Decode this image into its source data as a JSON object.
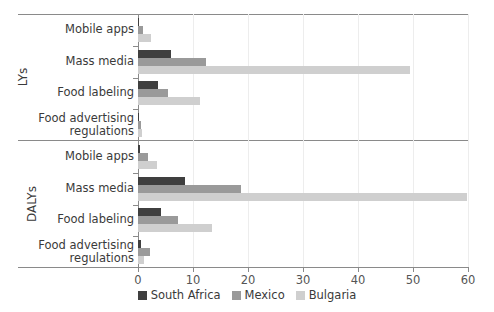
{
  "chart_data": {
    "type": "bar",
    "orientation": "horizontal",
    "title": "",
    "xlabel": "",
    "ylabel": "",
    "xlim": [
      0,
      60
    ],
    "xticks": [
      0,
      10,
      20,
      30,
      40,
      50,
      60
    ],
    "grid": true,
    "legend_position": "bottom",
    "panels": [
      {
        "name": "LYs",
        "categories": [
          "Mobile apps",
          "Mass media",
          "Food labeling",
          "Food advertising regulations"
        ],
        "series": [
          {
            "name": "South Africa",
            "color": "#3f3f3f",
            "values": [
              0.2,
              6.0,
              3.6,
              0.2
            ]
          },
          {
            "name": "Mexico",
            "color": "#9a9a9a",
            "values": [
              0.9,
              12.3,
              5.4,
              0.6
            ]
          },
          {
            "name": "Bulgaria",
            "color": "#cfcfcf",
            "values": [
              2.3,
              49.5,
              11.2,
              0.7
            ]
          }
        ]
      },
      {
        "name": "DALYs",
        "categories": [
          "Mobile apps",
          "Mass media",
          "Food labeling",
          "Food advertising regulations"
        ],
        "series": [
          {
            "name": "South Africa",
            "color": "#3f3f3f",
            "values": [
              0.3,
              8.5,
              4.2,
              0.5
            ]
          },
          {
            "name": "Mexico",
            "color": "#9a9a9a",
            "values": [
              1.8,
              18.8,
              7.3,
              2.1
            ]
          },
          {
            "name": "Bulgaria",
            "color": "#cfcfcf",
            "values": [
              3.4,
              59.8,
              13.5,
              1.1
            ]
          }
        ]
      }
    ],
    "legend": [
      {
        "label": "South Africa",
        "color": "#3f3f3f"
      },
      {
        "label": "Mexico",
        "color": "#9a9a9a"
      },
      {
        "label": "Bulgaria",
        "color": "#cfcfcf"
      }
    ]
  }
}
